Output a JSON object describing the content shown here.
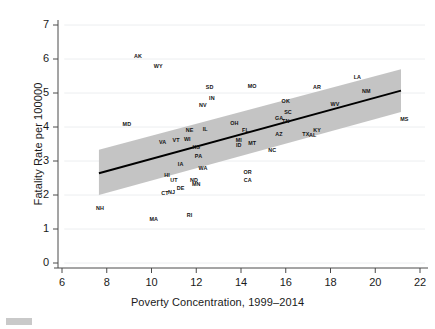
{
  "chart_data": {
    "type": "scatter",
    "title": "",
    "subtitle": "",
    "xlabel": "Poverty Concentration, 1999–2014",
    "ylabel": "Fatality Rate per 100000",
    "xlim": [
      6,
      22
    ],
    "ylim": [
      0,
      7
    ],
    "xticks": [
      6,
      8,
      10,
      12,
      14,
      16,
      18,
      20,
      22
    ],
    "yticks": [
      0,
      1,
      2,
      3,
      4,
      5,
      6,
      7
    ],
    "grid": "horizontal-light",
    "legend": "none",
    "point_marker": "text-labels-only",
    "series": [
      {
        "name": "US states",
        "labels": [
          "AK",
          "WY",
          "MD",
          "SD",
          "IN",
          "NV",
          "MO",
          "NE",
          "VA",
          "VT",
          "WI",
          "IL",
          "OH",
          "FL",
          "KS",
          "MI",
          "ID",
          "PA",
          "MT",
          "IA",
          "WA",
          "HI",
          "UT",
          "DE",
          "ND",
          "MN",
          "CT",
          "NJ",
          "NH",
          "MA",
          "RI",
          "OR",
          "CA",
          "NC",
          "AZ",
          "TX",
          "KY",
          "AL",
          "OK",
          "SC",
          "GA",
          "TN",
          "AR",
          "WV",
          "LA",
          "NM",
          "MS"
        ],
        "x": [
          9.4,
          10.3,
          8.9,
          12.6,
          12.7,
          12.3,
          14.5,
          11.7,
          10.5,
          11.1,
          11.6,
          12.4,
          13.7,
          14.2,
          12.0,
          13.9,
          13.9,
          12.1,
          14.5,
          11.3,
          12.3,
          10.7,
          11.0,
          11.3,
          11.9,
          12.0,
          10.6,
          10.9,
          7.7,
          10.1,
          11.7,
          14.3,
          14.3,
          15.4,
          15.7,
          16.9,
          17.4,
          17.2,
          16.0,
          16.1,
          15.7,
          16.0,
          17.4,
          18.2,
          19.2,
          19.6,
          21.3
        ],
        "y": [
          6.1,
          5.78,
          4.08,
          5.17,
          4.85,
          4.66,
          5.2,
          3.92,
          3.55,
          3.62,
          3.64,
          3.94,
          4.12,
          3.91,
          3.42,
          3.62,
          3.46,
          3.15,
          3.52,
          2.92,
          2.8,
          2.58,
          2.43,
          2.22,
          2.45,
          2.32,
          2.05,
          2.1,
          1.62,
          1.28,
          1.41,
          2.68,
          2.44,
          3.32,
          3.78,
          3.79,
          3.92,
          3.77,
          4.76,
          4.45,
          4.27,
          4.18,
          5.17,
          4.68,
          5.47,
          5.06,
          4.23
        ]
      }
    ],
    "fit_line": {
      "name": "linear fit",
      "x_start": 7.65,
      "y_start": 2.64,
      "x_end": 21.15,
      "y_end": 5.07,
      "color": "#000000"
    },
    "confidence_band": {
      "name": "95% CI",
      "color": "#bfbfbf",
      "x_start": 7.65,
      "x_end": 21.15,
      "upper_start": 3.33,
      "lower_start": 2.0,
      "upper_end": 5.7,
      "lower_end": 4.44
    }
  },
  "axes": {
    "y_tick_labels": [
      "7",
      "6",
      "5",
      "4",
      "3",
      "2",
      "1",
      "0"
    ],
    "x_tick_labels": [
      "6",
      "8",
      "10",
      "12",
      "14",
      "16",
      "18",
      "20",
      "22"
    ],
    "x_title": "Poverty Concentration, 1999–2014",
    "y_title": "Fatality Rate per 100000"
  }
}
